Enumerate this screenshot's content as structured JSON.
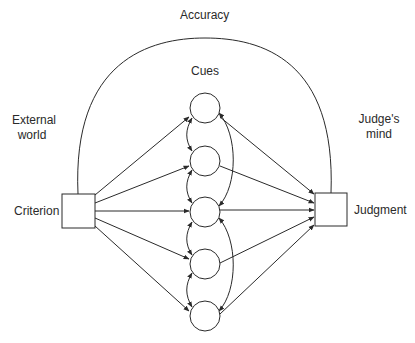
{
  "diagram": {
    "type": "lens-model",
    "labels": {
      "accuracy": "Accuracy",
      "cues": "Cues",
      "external_world_line1": "External",
      "external_world_line2": "world",
      "judges_mind_line1": "Judge's",
      "judges_mind_line2": "mind",
      "criterion": "Criterion",
      "judgment": "Judgment"
    },
    "nodes": {
      "criterion": {
        "shape": "square",
        "label": "Criterion"
      },
      "judgment": {
        "shape": "square",
        "label": "Judgment"
      },
      "cues": [
        {
          "shape": "circle",
          "index": 1
        },
        {
          "shape": "circle",
          "index": 2
        },
        {
          "shape": "circle",
          "index": 3
        },
        {
          "shape": "circle",
          "index": 4
        },
        {
          "shape": "circle",
          "index": 5
        }
      ]
    },
    "edges": {
      "criterion_to_cues": 5,
      "cues_to_judgment": 5,
      "cue_intercorrelation_arcs": 6,
      "accuracy_arc": "criterion-judgment"
    },
    "colors": {
      "line": "#2a2a2a",
      "background": "#ffffff"
    }
  }
}
